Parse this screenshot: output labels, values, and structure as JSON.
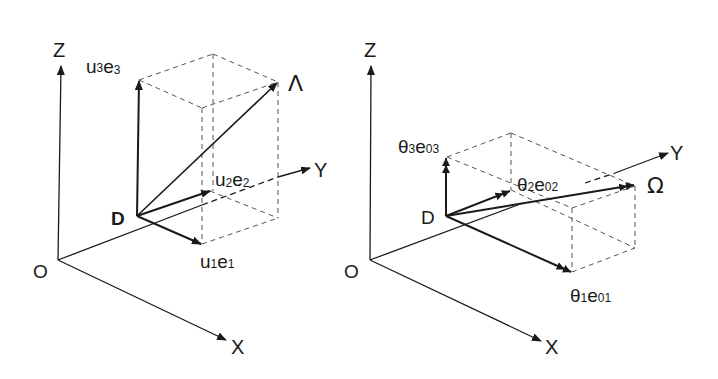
{
  "figure": {
    "panels": [
      {
        "id": "left",
        "axes": {
          "x": "X",
          "y": "Y",
          "z": "Z",
          "origin": "O"
        },
        "point": "D",
        "resultant": "Λ",
        "components": [
          {
            "coef": "u",
            "coef_sub": "1",
            "basis": "e",
            "basis_sub": "1"
          },
          {
            "coef": "u",
            "coef_sub": "2",
            "basis": "e",
            "basis_sub": "2"
          },
          {
            "coef": "u",
            "coef_sub": "3",
            "basis": "e",
            "basis_sub": "3"
          }
        ]
      },
      {
        "id": "right",
        "axes": {
          "x": "X",
          "y": "Y",
          "z": "Z",
          "origin": "O"
        },
        "point": "D",
        "resultant": "Ω",
        "components": [
          {
            "coef": "θ",
            "coef_sub": "1",
            "basis": "e",
            "basis_sub": "01"
          },
          {
            "coef": "θ",
            "coef_sub": "2",
            "basis": "e",
            "basis_sub": "02"
          },
          {
            "coef": "θ",
            "coef_sub": "3",
            "basis": "e",
            "basis_sub": "03"
          }
        ]
      }
    ],
    "colors": {
      "line": "#1a1a1a",
      "dashed": "#555555",
      "background": "#ffffff"
    }
  }
}
